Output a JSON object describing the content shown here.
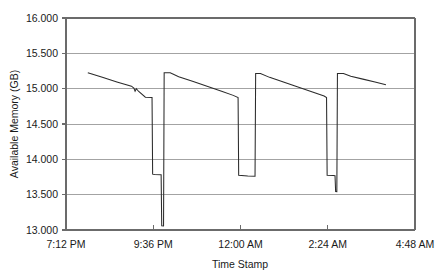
{
  "chart_data": {
    "type": "line",
    "title": "",
    "xlabel": "Time Stamp",
    "ylabel": "Available Memory (GB)",
    "ylim": [
      13.0,
      16.0
    ],
    "ytick_labels": [
      "13.000",
      "13.500",
      "14.000",
      "14.500",
      "15.000",
      "15.500",
      "16.000"
    ],
    "ytick_values": [
      13.0,
      13.5,
      14.0,
      14.5,
      15.0,
      15.5,
      16.0
    ],
    "xtick_labels": [
      "7:12 PM",
      "9:36 PM",
      "12:00 AM",
      "2:24 AM",
      "4:48 AM"
    ],
    "xtick_values": [
      0,
      144,
      288,
      432,
      576
    ],
    "xlim": [
      0,
      576
    ],
    "grid": "horizontal",
    "legend": "none",
    "series": [
      {
        "name": "Available Memory",
        "units": "GB",
        "x_units": "minutes since 7:12 PM",
        "points": [
          [
            36,
            15.225
          ],
          [
            60,
            15.16
          ],
          [
            84,
            15.095
          ],
          [
            108,
            15.035
          ],
          [
            112,
            15.01
          ],
          [
            114,
            14.965
          ],
          [
            116,
            15.0
          ],
          [
            120,
            14.96
          ],
          [
            131,
            14.88
          ],
          [
            142,
            14.875
          ],
          [
            143,
            13.79
          ],
          [
            146,
            13.785
          ],
          [
            157,
            13.782
          ],
          [
            158,
            13.06
          ],
          [
            161,
            13.058
          ],
          [
            162,
            15.225
          ],
          [
            172,
            15.225
          ],
          [
            186,
            15.17
          ],
          [
            210,
            15.1
          ],
          [
            234,
            15.03
          ],
          [
            258,
            14.96
          ],
          [
            276,
            14.905
          ],
          [
            284,
            14.875
          ],
          [
            285,
            13.775
          ],
          [
            300,
            13.765
          ],
          [
            312,
            13.76
          ],
          [
            313,
            15.215
          ],
          [
            321,
            15.215
          ],
          [
            336,
            15.16
          ],
          [
            360,
            15.09
          ],
          [
            384,
            15.02
          ],
          [
            408,
            14.95
          ],
          [
            426,
            14.895
          ],
          [
            430,
            14.875
          ],
          [
            431,
            13.775
          ],
          [
            441,
            13.77
          ],
          [
            444,
            13.768
          ],
          [
            445,
            13.545
          ],
          [
            447,
            13.543
          ],
          [
            448,
            15.215
          ],
          [
            458,
            15.215
          ],
          [
            470,
            15.175
          ],
          [
            490,
            15.135
          ],
          [
            510,
            15.095
          ],
          [
            528,
            15.055
          ]
        ]
      }
    ],
    "annotations": []
  },
  "colors": {
    "series_line": "#2b2b2b",
    "gridline": "#8c8c8c",
    "axis": "#6b6b6b",
    "text": "#1a1a1a",
    "background": "#ffffff"
  }
}
